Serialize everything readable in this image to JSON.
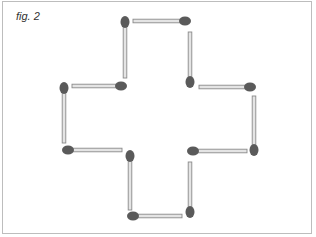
{
  "figure": {
    "label": "fig. 2",
    "colors": {
      "stick": "#e4e4e4",
      "stick_outline": "#8a8a8a",
      "head": "#5a5a5a",
      "frame": "#bdbdbd"
    },
    "matches": [
      {
        "id": 1,
        "orientation": "horizontal",
        "x1": 133,
        "y1": 21,
        "x2": 185,
        "y2": 21,
        "head": "end"
      },
      {
        "id": 2,
        "orientation": "vertical",
        "x1": 125,
        "y1": 22,
        "x2": 125,
        "y2": 78,
        "head": "start"
      },
      {
        "id": 3,
        "orientation": "vertical",
        "x1": 190,
        "y1": 32,
        "x2": 190,
        "y2": 82,
        "head": "end"
      },
      {
        "id": 4,
        "orientation": "horizontal",
        "x1": 72,
        "y1": 86,
        "x2": 121,
        "y2": 86,
        "head": "end"
      },
      {
        "id": 5,
        "orientation": "vertical",
        "x1": 64,
        "y1": 88,
        "x2": 64,
        "y2": 143,
        "head": "start"
      },
      {
        "id": 6,
        "orientation": "horizontal",
        "x1": 199,
        "y1": 87,
        "x2": 250,
        "y2": 87,
        "head": "end"
      },
      {
        "id": 7,
        "orientation": "vertical",
        "x1": 254,
        "y1": 96,
        "x2": 254,
        "y2": 150,
        "head": "end"
      },
      {
        "id": 8,
        "orientation": "horizontal",
        "x1": 68,
        "y1": 150,
        "x2": 122,
        "y2": 150,
        "head": "start"
      },
      {
        "id": 9,
        "orientation": "horizontal",
        "x1": 193,
        "y1": 151,
        "x2": 247,
        "y2": 151,
        "head": "start"
      },
      {
        "id": 10,
        "orientation": "vertical",
        "x1": 130,
        "y1": 156,
        "x2": 130,
        "y2": 210,
        "head": "start"
      },
      {
        "id": 11,
        "orientation": "vertical",
        "x1": 190,
        "y1": 162,
        "x2": 190,
        "y2": 212,
        "head": "end"
      },
      {
        "id": 12,
        "orientation": "horizontal",
        "x1": 133,
        "y1": 216,
        "x2": 182,
        "y2": 216,
        "head": "start"
      }
    ]
  }
}
